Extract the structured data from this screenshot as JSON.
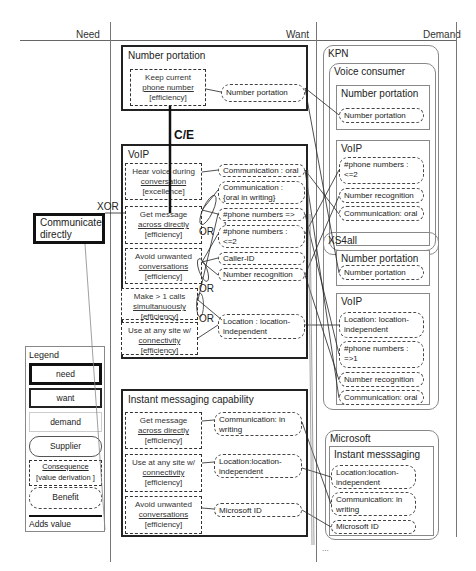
{
  "columns": {
    "need": "Need",
    "want": "Want",
    "demand": "Demand"
  },
  "need": {
    "label": "Communicate directly",
    "operator": "XOR"
  },
  "want": {
    "ce_label": "C/E",
    "or_label_1": "OR",
    "or_label_2": "OR",
    "or_label_3": "OR",
    "number_portation": {
      "title": "Number portation",
      "consequences": [
        {
          "line1": "Keep current",
          "line2": "phone number",
          "line3": "[efficiency]"
        }
      ],
      "benefits": [
        "Number portation"
      ]
    },
    "voip": {
      "title": "VoIP",
      "consequences": [
        {
          "line1": "Hear voice during",
          "line2": "conversation",
          "line3": "[excellence]"
        },
        {
          "line1": "Get message",
          "line2": "across directly",
          "line3": "[efficiency]"
        },
        {
          "line1": "Avoid unwanted",
          "line2": "conversations",
          "line3": "[efficiency]"
        },
        {
          "line1": "Make > 1 calls",
          "line2": "simultanuously",
          "line3": "[efficiency]"
        },
        {
          "line1": "Use at any site w/",
          "line2": "connectivity",
          "line3": "[efficiency]"
        }
      ],
      "benefits": [
        "Communication : oral",
        "Communication : {oral in writing}",
        "#phone numbers  => 1",
        "#phone numbers : <=2",
        "Caller-ID",
        "Number recognition",
        "Location :  location-independent"
      ]
    },
    "im": {
      "title": "Instant messaging capability",
      "consequences": [
        {
          "line1": "Get message",
          "line2": "across directly",
          "line3": "[efficiency]"
        },
        {
          "line1": "Use at any site w/",
          "line2": "connectivity",
          "line3": "[efficiency]"
        },
        {
          "line1": "Avoid unwanted",
          "line2": "conversations",
          "line3": "[efficiency]"
        }
      ],
      "benefits": [
        "Communication: in writing",
        "Location:location-independent",
        "Microsoft ID"
      ]
    }
  },
  "demand": {
    "kpn": {
      "name": "KPN",
      "segment": "Voice consumer",
      "products": [
        {
          "title": "Number portation",
          "benefits": [
            "Number portation"
          ]
        },
        {
          "title": "VoIP",
          "benefits": [
            "#phone numbers : <=2",
            "Number recognition",
            "Communication: oral"
          ]
        }
      ]
    },
    "xs4all": {
      "name": "XS4all",
      "products": [
        {
          "title": "Number portation",
          "benefits": [
            "Number portation"
          ]
        },
        {
          "title": "VoIP",
          "benefits": [
            "Location: location-independent",
            "#phone numbers : =>1",
            "Number recognition",
            "Communication: oral"
          ]
        }
      ]
    },
    "microsoft": {
      "name": "Microsoft",
      "products": [
        {
          "title": "Instant messsaging",
          "benefits": [
            "Location:location-independent",
            "Communication: in writing",
            "Microsoft ID"
          ]
        }
      ]
    },
    "ellipsis": "..."
  },
  "legend": {
    "title": "Legend",
    "items": {
      "need": "need",
      "want": "want",
      "demand": "demand",
      "supplier": "Supplier",
      "consequence_line1": "Consequence",
      "consequence_line2": "[value derivation ]",
      "benefit": "Benefit",
      "adds_value": "Adds value"
    }
  }
}
